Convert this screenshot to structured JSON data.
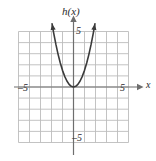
{
  "figure": {
    "name": "coordinate-plane-graph",
    "background_color": "#ffffff",
    "grid_color": "#bcbcbc",
    "axis_color": "#6e6e6e",
    "curve_color": "#3a3a3a"
  },
  "labels": {
    "function_label": "h(x)",
    "x_axis_label": "x",
    "x_tick_negative": "–5",
    "x_tick_positive": "5",
    "y_tick_positive": "5",
    "y_tick_negative": "–5"
  },
  "chart_data": {
    "type": "line",
    "title": "h(x)",
    "xlabel": "x",
    "ylabel": "h(x)",
    "xlim": [
      -5,
      5
    ],
    "ylim": [
      -5,
      5
    ],
    "grid": true,
    "legend": false,
    "xticks": [
      -5,
      5
    ],
    "yticks": [
      -5,
      5
    ],
    "grid_step": 1,
    "series": [
      {
        "name": "h(x)",
        "shape": "parabola-upward",
        "vertex": [
          0,
          0
        ],
        "leading_coefficient": 1.5,
        "arrowheads": [
          "start",
          "end"
        ],
        "x": [
          -1.95,
          -1.8,
          -1.6,
          -1.4,
          -1.2,
          -1.0,
          -0.8,
          -0.6,
          -0.4,
          -0.2,
          0,
          0.2,
          0.4,
          0.6,
          0.8,
          1.0,
          1.2,
          1.4,
          1.6,
          1.8,
          1.95
        ],
        "y": [
          5.7,
          4.86,
          3.84,
          2.94,
          2.16,
          1.5,
          0.96,
          0.54,
          0.24,
          0.06,
          0,
          0.06,
          0.24,
          0.54,
          0.96,
          1.5,
          2.16,
          2.94,
          3.84,
          4.86,
          5.7
        ]
      }
    ]
  }
}
